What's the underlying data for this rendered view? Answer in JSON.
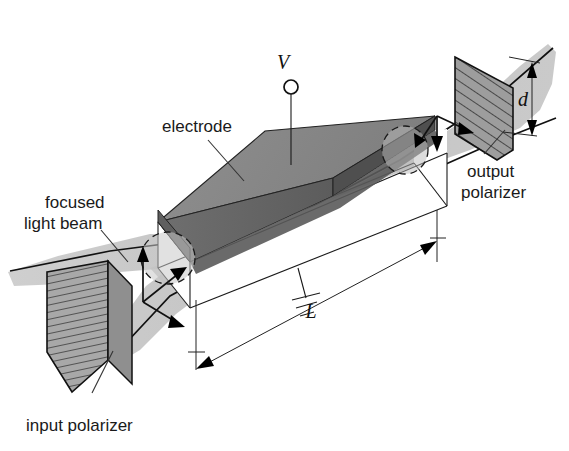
{
  "figure": {
    "background_color": "#ffffff",
    "width": 569,
    "height": 451
  },
  "labels": {
    "electrode": "electrode",
    "focused_light_beam_line1": "focused",
    "focused_light_beam_line2": "light beam",
    "input_polarizer": "input polarizer",
    "output_polarizer_line1": "output",
    "output_polarizer_line2": "polarizer",
    "voltage_symbol": "V",
    "length_symbol": "L",
    "aperture_symbol": "d"
  },
  "colors": {
    "beam_light": "#c9c9c9",
    "beam_mid": "#b4b4b4",
    "electrode_top": "#8a8a8a",
    "electrode_front": "#6a6a6a",
    "electrode_side": "#565656",
    "polarizer_fill": "#a8a8a8",
    "crystal_face": "#d4d4d4",
    "crystal_body": "#ffffff",
    "line": "#1a1a1a",
    "text": "#1a1a1a"
  },
  "elements": {
    "input_polarizer_hatch": "horizontal-hatch",
    "output_polarizer_hatch": "diagonal-hatch",
    "input_polarization_arrows": "three-arm-arrow-up-right-down",
    "output_polarization_arrows": "three-arm-arrow-downleft-down-right",
    "ground_symbol": "earth-ground-3-bar",
    "voltage_terminal": "open-circle-terminal",
    "beam_waist_circles": "dashed-ellipse"
  }
}
